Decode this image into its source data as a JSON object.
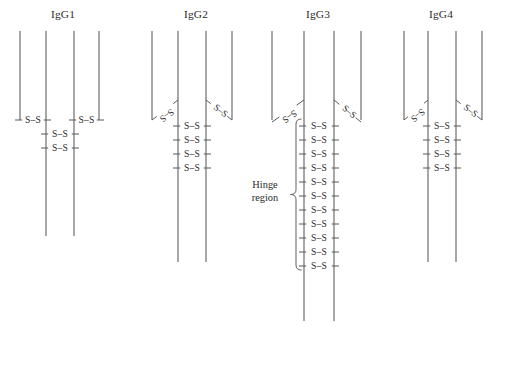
{
  "figure": {
    "type": "diagram",
    "background_color": "#ffffff",
    "line_color": "#58585a",
    "text_color": "#2b2b2b",
    "width": 505,
    "height": 369
  },
  "bond_label": "S–S",
  "hinge": {
    "line1": "Hinge",
    "line2": "region",
    "brace_glyph": "left-curly-brace"
  },
  "isotypes": [
    {
      "id": "igg1",
      "title": "IgG1",
      "title_x": 63,
      "title_y": 18,
      "chains": [
        {
          "name": "light-chain-left",
          "x": 20,
          "y1": 31,
          "y2": 120
        },
        {
          "name": "heavy-chain-left",
          "x": 46,
          "y1": 31,
          "y2": 236
        },
        {
          "name": "heavy-chain-right",
          "x": 74,
          "y1": 31,
          "y2": 236
        },
        {
          "name": "light-chain-right",
          "x": 99,
          "y1": 31,
          "y2": 120
        }
      ],
      "horizontal_bonds": [
        {
          "name": "light-heavy-left",
          "x1": 20,
          "x2": 46,
          "y": 120
        },
        {
          "name": "light-heavy-right",
          "x1": 74,
          "x2": 99,
          "y": 120
        },
        {
          "name": "hinge-bond-1",
          "x1": 46,
          "x2": 74,
          "y": 134
        },
        {
          "name": "hinge-bond-2",
          "x1": 46,
          "x2": 74,
          "y": 148
        }
      ],
      "diagonal_bonds": [],
      "hinge_bond_count": 2,
      "has_hinge_brace": false
    },
    {
      "id": "igg2",
      "title": "IgG2",
      "title_x": 196,
      "title_y": 18,
      "chains": [
        {
          "name": "light-chain-left",
          "x": 152,
          "y1": 31,
          "y2": 120
        },
        {
          "name": "heavy-chain-left",
          "x": 178,
          "y1": 31,
          "y2": 262
        },
        {
          "name": "heavy-chain-right",
          "x": 206,
          "y1": 31,
          "y2": 262
        },
        {
          "name": "light-chain-right",
          "x": 232,
          "y1": 31,
          "y2": 120
        }
      ],
      "horizontal_bonds": [
        {
          "name": "hinge-bond-1",
          "x1": 178,
          "x2": 206,
          "y": 126
        },
        {
          "name": "hinge-bond-2",
          "x1": 178,
          "x2": 206,
          "y": 140
        },
        {
          "name": "hinge-bond-3",
          "x1": 178,
          "x2": 206,
          "y": 154
        },
        {
          "name": "hinge-bond-4",
          "x1": 178,
          "x2": 206,
          "y": 168
        }
      ],
      "diagonal_bonds": [
        {
          "name": "light-heavy-left",
          "x1": 178,
          "y1": 100,
          "x2": 152,
          "y2": 120
        },
        {
          "name": "light-heavy-right",
          "x1": 206,
          "y1": 100,
          "x2": 232,
          "y2": 120
        }
      ],
      "hinge_bond_count": 4,
      "has_hinge_brace": false
    },
    {
      "id": "igg3",
      "title": "IgG3",
      "title_x": 318,
      "title_y": 18,
      "chains": [
        {
          "name": "light-chain-left",
          "x": 272,
          "y1": 31,
          "y2": 120
        },
        {
          "name": "heavy-chain-left",
          "x": 304,
          "y1": 31,
          "y2": 321
        },
        {
          "name": "heavy-chain-right",
          "x": 334,
          "y1": 31,
          "y2": 321
        },
        {
          "name": "light-chain-right",
          "x": 361,
          "y1": 31,
          "y2": 120
        }
      ],
      "horizontal_bonds": [
        {
          "name": "hinge-bond-1",
          "x1": 304,
          "x2": 334,
          "y": 126
        },
        {
          "name": "hinge-bond-2",
          "x1": 304,
          "x2": 334,
          "y": 140
        },
        {
          "name": "hinge-bond-3",
          "x1": 304,
          "x2": 334,
          "y": 154
        },
        {
          "name": "hinge-bond-4",
          "x1": 304,
          "x2": 334,
          "y": 168
        },
        {
          "name": "hinge-bond-5",
          "x1": 304,
          "x2": 334,
          "y": 182
        },
        {
          "name": "hinge-bond-6",
          "x1": 304,
          "x2": 334,
          "y": 196
        },
        {
          "name": "hinge-bond-7",
          "x1": 304,
          "x2": 334,
          "y": 210
        },
        {
          "name": "hinge-bond-8",
          "x1": 304,
          "x2": 334,
          "y": 224
        },
        {
          "name": "hinge-bond-9",
          "x1": 304,
          "x2": 334,
          "y": 238
        },
        {
          "name": "hinge-bond-10",
          "x1": 304,
          "x2": 334,
          "y": 252
        },
        {
          "name": "hinge-bond-11",
          "x1": 304,
          "x2": 334,
          "y": 266
        }
      ],
      "diagonal_bonds": [
        {
          "name": "light-heavy-left",
          "x1": 304,
          "y1": 100,
          "x2": 272,
          "y2": 122
        },
        {
          "name": "light-heavy-right",
          "x1": 334,
          "y1": 100,
          "x2": 361,
          "y2": 122
        }
      ],
      "hinge_bond_count": 11,
      "has_hinge_brace": true,
      "brace": {
        "x": 296,
        "y_top": 119,
        "y_bottom": 270
      },
      "hinge_label_x": 265,
      "hinge_label_y1": 188,
      "hinge_label_y2": 201
    },
    {
      "id": "igg4",
      "title": "IgG4",
      "title_x": 441,
      "title_y": 18,
      "chains": [
        {
          "name": "light-chain-left",
          "x": 404,
          "y1": 31,
          "y2": 120
        },
        {
          "name": "heavy-chain-left",
          "x": 428,
          "y1": 31,
          "y2": 262
        },
        {
          "name": "heavy-chain-right",
          "x": 456,
          "y1": 31,
          "y2": 262
        },
        {
          "name": "light-chain-right",
          "x": 482,
          "y1": 31,
          "y2": 120
        }
      ],
      "horizontal_bonds": [
        {
          "name": "hinge-bond-1",
          "x1": 428,
          "x2": 456,
          "y": 126
        },
        {
          "name": "hinge-bond-2",
          "x1": 428,
          "x2": 456,
          "y": 140
        },
        {
          "name": "hinge-bond-3",
          "x1": 428,
          "x2": 456,
          "y": 154
        },
        {
          "name": "hinge-bond-4",
          "x1": 428,
          "x2": 456,
          "y": 168
        }
      ],
      "diagonal_bonds": [
        {
          "name": "light-heavy-left",
          "x1": 428,
          "y1": 100,
          "x2": 404,
          "y2": 120
        },
        {
          "name": "light-heavy-right",
          "x1": 456,
          "y1": 100,
          "x2": 482,
          "y2": 120
        }
      ],
      "hinge_bond_count": 4,
      "has_hinge_brace": false
    }
  ]
}
